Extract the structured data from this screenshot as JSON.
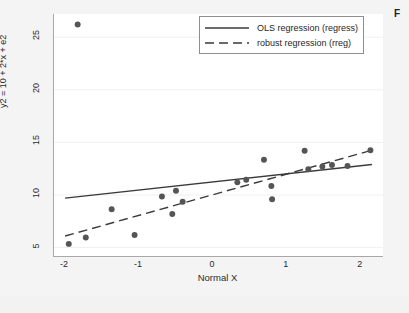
{
  "corner_text": "F",
  "legend": {
    "position": "top-right-inside",
    "items": [
      {
        "label": "OLS regression (regress)",
        "style": "solid",
        "color": "#3a3a3a"
      },
      {
        "label": "robust regression (rreg)",
        "style": "dashed",
        "color": "#3a3a3a"
      }
    ]
  },
  "chart_data": {
    "type": "scatter",
    "title": "",
    "subtitle": "",
    "xlabel": "Normal X",
    "ylabel": "y2 = 10 + 2*x + e2",
    "xlim": [
      -2.15,
      2.3
    ],
    "ylim": [
      4.2,
      27.2
    ],
    "xticks": [
      -2,
      -1,
      0,
      1,
      2
    ],
    "xtick_labels": [
      "-2",
      "-1",
      "0",
      "1",
      "2"
    ],
    "yticks": [
      5,
      10,
      15,
      20,
      25
    ],
    "ytick_labels": [
      "5",
      "10",
      "15",
      "20",
      "25"
    ],
    "grid": "horizontal-faint",
    "marker_color": "#555555",
    "marker_size": 4,
    "points": [
      {
        "x": -1.95,
        "y": 5.35
      },
      {
        "x": -1.83,
        "y": 26.2
      },
      {
        "x": -1.72,
        "y": 5.95
      },
      {
        "x": -1.37,
        "y": 8.65
      },
      {
        "x": -1.06,
        "y": 6.2
      },
      {
        "x": -0.69,
        "y": 9.85
      },
      {
        "x": -0.55,
        "y": 8.2
      },
      {
        "x": -0.5,
        "y": 10.4
      },
      {
        "x": -0.41,
        "y": 9.35
      },
      {
        "x": 0.33,
        "y": 11.2
      },
      {
        "x": 0.45,
        "y": 11.45
      },
      {
        "x": 0.69,
        "y": 13.35
      },
      {
        "x": 0.79,
        "y": 10.85
      },
      {
        "x": 0.8,
        "y": 9.6
      },
      {
        "x": 1.24,
        "y": 14.2
      },
      {
        "x": 1.29,
        "y": 12.45
      },
      {
        "x": 1.48,
        "y": 12.7
      },
      {
        "x": 1.61,
        "y": 12.85
      },
      {
        "x": 1.82,
        "y": 12.75
      },
      {
        "x": 2.13,
        "y": 14.25
      }
    ],
    "series": [
      {
        "name": "OLS regression (regress)",
        "type": "line",
        "style": "solid",
        "color": "#3a3a3a",
        "x": [
          -2.0,
          2.15
        ],
        "y": [
          9.7,
          12.9
        ],
        "slope": 0.77,
        "intercept": 11.24
      },
      {
        "name": "robust regression (rreg)",
        "type": "line",
        "style": "dashed",
        "color": "#3a3a3a",
        "x": [
          -2.0,
          2.15
        ],
        "y": [
          6.1,
          14.25
        ],
        "slope": 1.96,
        "intercept": 10.02
      }
    ]
  }
}
